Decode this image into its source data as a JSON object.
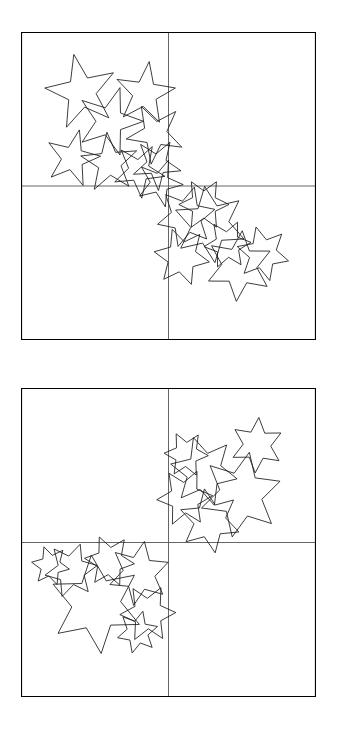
{
  "figure": {
    "title": "",
    "background_color": "#ffffff",
    "stroke_color": "#1a1a1a",
    "frame_color": "#000000",
    "divider_color": "#555555",
    "panel_count": 2,
    "quadrants_per_panel": 4
  },
  "chart_data": {
    "type": "scatter",
    "title": "",
    "xlabel": "",
    "ylabel": "",
    "xlim": [
      0,
      1
    ],
    "ylim": [
      0,
      1
    ],
    "grid": false,
    "legend": null,
    "marker": "star-outline",
    "panels": [
      {
        "name": "panel-1",
        "occupied_quadrants": [
          "top-left",
          "bottom-right"
        ],
        "empty_quadrants": [
          "top-right",
          "bottom-left"
        ],
        "clusters": [
          {
            "quadrant": "top-left",
            "star_points": 5,
            "count": 9,
            "stars": [
              {
                "cx": 0.205,
                "cy": 0.195,
                "r": 0.125,
                "rot": -12
              },
              {
                "cx": 0.3,
                "cy": 0.29,
                "r": 0.115,
                "rot": 18
              },
              {
                "cx": 0.42,
                "cy": 0.2,
                "r": 0.105,
                "rot": 8
              },
              {
                "cx": 0.455,
                "cy": 0.33,
                "r": 0.1,
                "rot": -28
              },
              {
                "cx": 0.175,
                "cy": 0.41,
                "r": 0.095,
                "rot": 14
              },
              {
                "cx": 0.3,
                "cy": 0.425,
                "r": 0.1,
                "rot": -5
              },
              {
                "cx": 0.4,
                "cy": 0.45,
                "r": 0.09,
                "rot": 30
              },
              {
                "cx": 0.46,
                "cy": 0.43,
                "r": 0.085,
                "rot": -40
              },
              {
                "cx": 0.47,
                "cy": 0.49,
                "r": 0.08,
                "rot": 22
              }
            ]
          },
          {
            "quadrant": "bottom-right",
            "star_points": 6,
            "count": 7,
            "stars": [
              {
                "cx": 0.64,
                "cy": 0.625,
                "r": 0.125,
                "rot": -8
              },
              {
                "cx": 0.56,
                "cy": 0.6,
                "r": 0.1,
                "rot": 16
              },
              {
                "cx": 0.545,
                "cy": 0.73,
                "r": 0.095,
                "rot": -20
              },
              {
                "cx": 0.62,
                "cy": 0.56,
                "r": 0.085,
                "rot": 30
              },
              {
                "cx": 0.74,
                "cy": 0.76,
                "r": 0.115,
                "rot": 5
              },
              {
                "cx": 0.82,
                "cy": 0.72,
                "r": 0.09,
                "rot": -15
              },
              {
                "cx": 0.7,
                "cy": 0.69,
                "r": 0.08,
                "rot": 25
              }
            ]
          }
        ]
      },
      {
        "name": "panel-2",
        "occupied_quadrants": [
          "top-right",
          "bottom-left"
        ],
        "empty_quadrants": [
          "top-left",
          "bottom-right"
        ],
        "clusters": [
          {
            "quadrant": "top-right",
            "star_points": 6,
            "count": 6,
            "stars": [
              {
                "cx": 0.8,
                "cy": 0.185,
                "r": 0.09,
                "rot": 4
              },
              {
                "cx": 0.62,
                "cy": 0.27,
                "r": 0.115,
                "rot": -18
              },
              {
                "cx": 0.745,
                "cy": 0.345,
                "r": 0.14,
                "rot": 12
              },
              {
                "cx": 0.555,
                "cy": 0.355,
                "r": 0.095,
                "rot": 26
              },
              {
                "cx": 0.64,
                "cy": 0.43,
                "r": 0.105,
                "rot": -10
              },
              {
                "cx": 0.56,
                "cy": 0.215,
                "r": 0.075,
                "rot": 33
              }
            ]
          },
          {
            "quadrant": "bottom-left",
            "star_points": 6,
            "count": 7,
            "stars": [
              {
                "cx": 0.255,
                "cy": 0.7,
                "r": 0.16,
                "rot": -6
              },
              {
                "cx": 0.17,
                "cy": 0.59,
                "r": 0.09,
                "rot": 20
              },
              {
                "cx": 0.3,
                "cy": 0.56,
                "r": 0.085,
                "rot": -24
              },
              {
                "cx": 0.4,
                "cy": 0.6,
                "r": 0.105,
                "rot": 10
              },
              {
                "cx": 0.43,
                "cy": 0.73,
                "r": 0.095,
                "rot": -32
              },
              {
                "cx": 0.1,
                "cy": 0.575,
                "r": 0.065,
                "rot": 40
              },
              {
                "cx": 0.395,
                "cy": 0.79,
                "r": 0.07,
                "rot": 15
              }
            ]
          }
        ]
      }
    ]
  }
}
